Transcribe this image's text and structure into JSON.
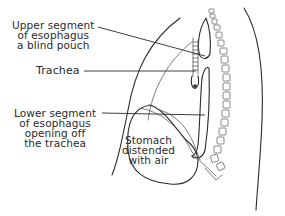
{
  "diagram": {
    "labels": {
      "upper_segment": [
        "Upper segment",
        "of esophagus",
        "a blind pouch"
      ],
      "trachea": "Trachea",
      "lower_segment": [
        "Lower segment",
        "of esophagus",
        "opening off",
        "the trachea"
      ],
      "stomach": [
        "Stomach",
        "distended",
        "with air"
      ]
    },
    "colors": {
      "line": "#2a2a2a",
      "background": "#ffffff"
    }
  }
}
